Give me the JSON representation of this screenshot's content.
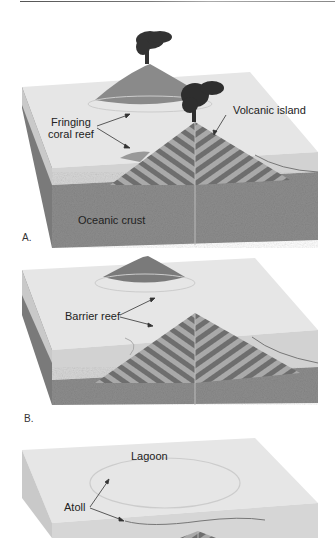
{
  "figure": {
    "panels": [
      {
        "letter": "A.",
        "labels": {
          "fringing_reef": [
            "Fringing",
            "coral reef"
          ],
          "volcanic_island": "Volcanic island",
          "crust": "Oceanic crust"
        }
      },
      {
        "letter": "B.",
        "labels": {
          "barrier_reef": "Barrier reef"
        }
      },
      {
        "letter": "",
        "labels": {
          "lagoon": "Lagoon",
          "atoll": "Atoll"
        }
      }
    ],
    "colors": {
      "sea_top": "#e4e4e4",
      "sea_side": "#cfcfcf",
      "crust": "#8d8d8d",
      "crust_dark": "#6f6f6f",
      "stripe_dark": "#6e6e6e",
      "stripe_light": "#a9a9a9",
      "smoke": "#2e2e2e",
      "island": "#7a7a7a",
      "text": "#222222"
    }
  }
}
